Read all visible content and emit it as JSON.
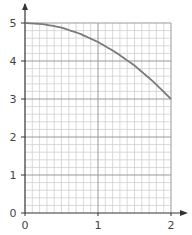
{
  "chart_data": {
    "type": "line",
    "title": "",
    "xlabel": "",
    "ylabel": "",
    "xlim": [
      0,
      2
    ],
    "ylim": [
      0,
      5
    ],
    "grid": true,
    "grid_minor_x": 0.1,
    "grid_minor_y": 0.2,
    "legend": null,
    "x_ticks": [
      "0",
      "1",
      "2"
    ],
    "y_ticks": [
      "0",
      "1",
      "2",
      "3",
      "4",
      "5"
    ],
    "series": [
      {
        "name": "curve",
        "x": [
          0,
          0.25,
          0.5,
          0.75,
          1.0,
          1.25,
          1.5,
          1.75,
          2.0
        ],
        "y": [
          5.0,
          4.97,
          4.88,
          4.72,
          4.5,
          4.22,
          3.88,
          3.47,
          3.0
        ]
      }
    ]
  },
  "colors": {
    "curve": "#7a7a7a",
    "major_grid": "#9a9a9a",
    "minor_grid": "#cfcfcf",
    "axis": "#333333"
  }
}
